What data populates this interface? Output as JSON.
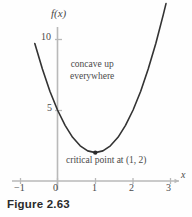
{
  "figure": {
    "caption": "Figure 2.63"
  },
  "annotations": {
    "concavity_line1": "concave up",
    "concavity_line2": "everywhere",
    "critical_point": "critical point at (1, 2)"
  },
  "colors": {
    "curve": "#333333",
    "axis": "#b9b9b9",
    "text": "#4a4a4a",
    "background": "#fefefe",
    "point": "#2b2b2b"
  },
  "chart_data": {
    "type": "line",
    "title": "",
    "subtitle": "",
    "xlabel": "x",
    "ylabel": "f(x)",
    "xlim": [
      -1.45,
      3.3
    ],
    "ylim": [
      -0.8,
      11.6
    ],
    "grid": false,
    "legend": null,
    "x_ticks": [
      -1,
      0,
      1,
      2,
      3
    ],
    "x_tick_labels": [
      "−1",
      "0",
      "1",
      "2",
      "3"
    ],
    "y_ticks": [
      5,
      10
    ],
    "y_tick_labels": [
      "5",
      "10"
    ],
    "function": "f(x) = 3(x - 1)^2 + 2",
    "series": [
      {
        "name": "f(x)",
        "x": [
          -0.6,
          -0.4,
          -0.2,
          0.0,
          0.2,
          0.4,
          0.6,
          0.8,
          1.0,
          1.2,
          1.4,
          1.6,
          1.8,
          2.0,
          2.2,
          2.4,
          2.6,
          2.8
        ],
        "y": [
          9.68,
          7.88,
          6.32,
          5.0,
          3.92,
          3.08,
          2.48,
          2.12,
          2.0,
          2.12,
          2.48,
          3.08,
          3.92,
          5.0,
          6.32,
          7.88,
          9.68,
          11.72
        ]
      }
    ],
    "points": [
      {
        "label": "critical point at (1, 2)",
        "x": 1,
        "y": 2
      }
    ],
    "annotations": [
      {
        "text": "concave up everywhere",
        "x": 1.35,
        "y": 8.2
      },
      {
        "text": "critical point at (1, 2)",
        "x": 1.6,
        "y": 0.9
      }
    ]
  }
}
